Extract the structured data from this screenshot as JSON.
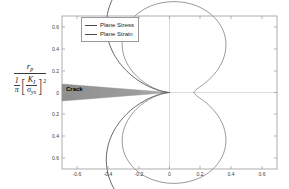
{
  "chart_data": {
    "type": "line",
    "title": "",
    "subtitle": "",
    "xlabel": "",
    "ylabel": "r_p / ( (1/pi) [ K_I / sigma_ys ]^2 )",
    "xlim": [
      -0.7,
      0.7
    ],
    "ylim": [
      -0.7,
      0.7
    ],
    "grid": false,
    "legend_position": "top-left",
    "xticks": [
      "-0.6",
      "-0.4",
      "-0.2",
      "0",
      "0.2",
      "0.4",
      "0.6"
    ],
    "xtick_values": [
      -0.6,
      -0.4,
      -0.2,
      0,
      0.2,
      0.4,
      0.6
    ],
    "yticks": [
      "0.6",
      "0.4",
      "0.2",
      "0",
      "0.2",
      "0.4",
      "0.6"
    ],
    "ytick_values": [
      0.6,
      0.4,
      0.2,
      0,
      -0.2,
      -0.4,
      -0.6
    ],
    "annotations": [
      {
        "text": "Crack",
        "x": -0.6,
        "y": 0.0
      }
    ],
    "series": [
      {
        "name": "Plane Stress",
        "color": "#4a4a4a",
        "max_x": 0.5,
        "max_y": 0.65,
        "min_y": -0.65,
        "theta_deg": [
          0,
          10,
          20,
          30,
          40,
          50,
          60,
          70,
          80,
          90,
          100,
          110,
          120,
          130,
          140,
          150,
          160,
          170,
          180
        ],
        "r": [
          0.5,
          0.508,
          0.532,
          0.569,
          0.611,
          0.651,
          0.679,
          0.69,
          0.679,
          0.646,
          0.591,
          0.519,
          0.434,
          0.343,
          0.251,
          0.163,
          0.086,
          0.026,
          0.0
        ]
      },
      {
        "name": "Plane Strain",
        "color": "#6a6a6a",
        "max_x": 0.18,
        "max_y": 0.41,
        "min_y": -0.41,
        "theta_deg": [
          0,
          10,
          20,
          30,
          40,
          50,
          60,
          70,
          80,
          90,
          100,
          110,
          120,
          130,
          140,
          150,
          160,
          170,
          180
        ],
        "r": [
          0.08,
          0.092,
          0.128,
          0.183,
          0.25,
          0.32,
          0.383,
          0.43,
          0.455,
          0.455,
          0.432,
          0.389,
          0.33,
          0.263,
          0.193,
          0.126,
          0.067,
          0.02,
          0.0
        ]
      }
    ]
  },
  "legend": {
    "items": [
      {
        "label": "Plane Stress"
      },
      {
        "label": "Plane Strain"
      }
    ]
  },
  "axis": {
    "x_ticks": [
      "-0.6",
      "-0.4",
      "-0.2",
      "0",
      "0.2",
      "0.4",
      "0.6"
    ],
    "y_ticks": [
      "0.6",
      "0.4",
      "0.2",
      "0",
      "0.2",
      "0.4",
      "0.6"
    ]
  },
  "ylabel": {
    "numerator": "r",
    "numerator_sub": "p",
    "den_one": "1",
    "den_pi": "π",
    "inner_num": "K",
    "inner_num_sub": "I",
    "inner_den": "σ",
    "inner_den_sub": "ys",
    "exponent": "2",
    "bracket_left": "[",
    "bracket_right": "]"
  },
  "crack": {
    "label": "Crack"
  }
}
